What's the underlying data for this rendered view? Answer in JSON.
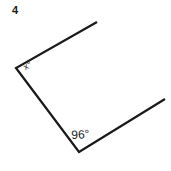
{
  "figure": {
    "problem_number": "4",
    "background_color": "#ffffff",
    "stroke_color": "#1a1a1a",
    "stroke_width": 2.2,
    "vertices": [
      {
        "name": "top-right-endpoint",
        "x": 97,
        "y": 22
      },
      {
        "name": "left-vertex",
        "x": 16,
        "y": 68
      },
      {
        "name": "bottom-vertex",
        "x": 79,
        "y": 152
      },
      {
        "name": "right-endpoint",
        "x": 165,
        "y": 99
      }
    ],
    "segments": [
      {
        "name": "upper-segment",
        "from": "top-right-endpoint",
        "to": "left-vertex"
      },
      {
        "name": "left-segment",
        "from": "left-vertex",
        "to": "bottom-vertex"
      },
      {
        "name": "right-segment",
        "from": "bottom-vertex",
        "to": "right-endpoint"
      }
    ],
    "labels": {
      "unknown_angle": "x°",
      "known_angle": "96°"
    }
  }
}
